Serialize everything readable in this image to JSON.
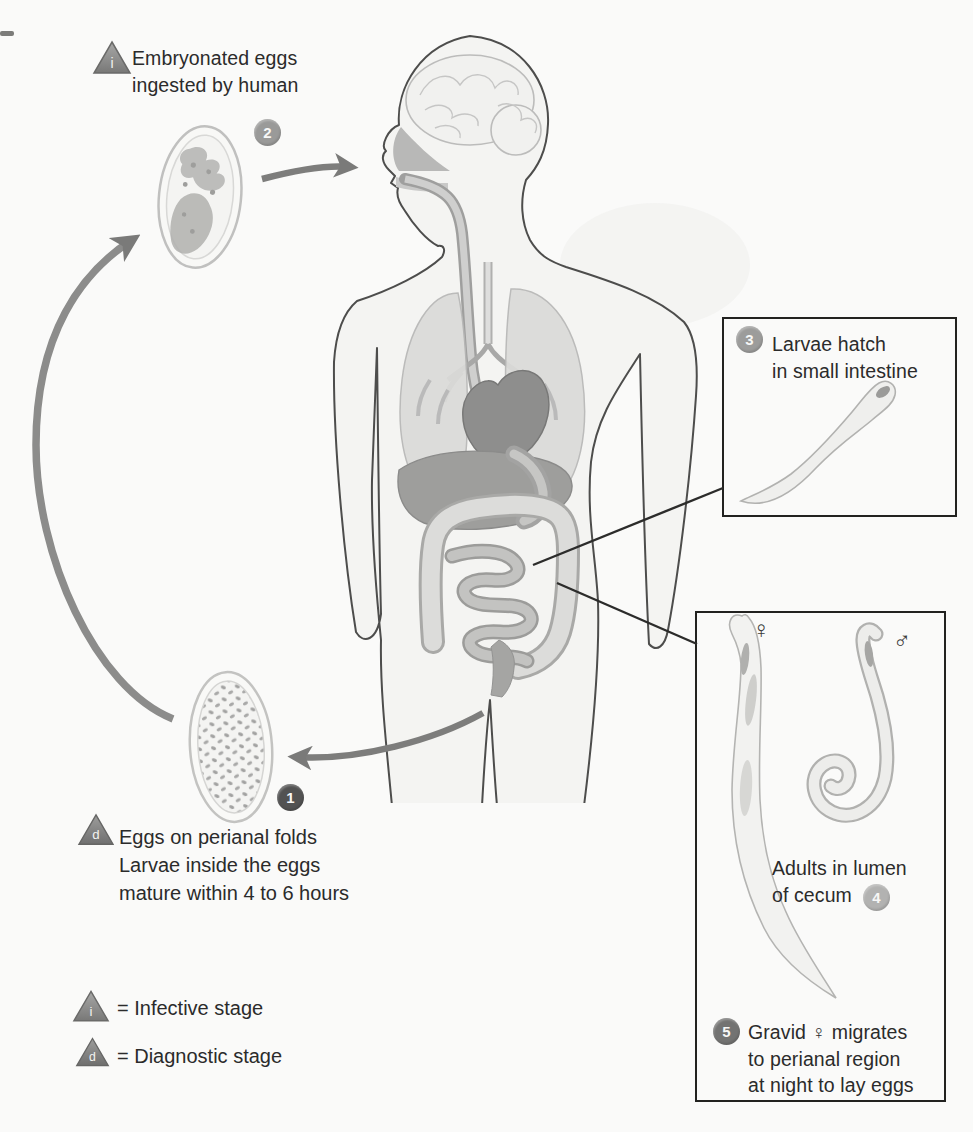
{
  "figure": {
    "title_semantic": "Pinworm life cycle diagram",
    "steps": [
      {
        "num": "1",
        "label": "Eggs on perianal folds\nLarvae inside the eggs\nmature within 4 to 6 hours"
      },
      {
        "num": "2",
        "label": "Embryonated eggs\ningested by human"
      },
      {
        "num": "3",
        "label": "Larvae hatch\nin small intestine"
      },
      {
        "num": "4",
        "label": "Adults in lumen\nof cecum"
      },
      {
        "num": "5",
        "label": "Gravid ♀ migrates\nto perianal region\nat night to lay eggs"
      }
    ],
    "markers": {
      "infective": "i",
      "diagnostic": "d"
    },
    "legend": {
      "infective": "= Infective stage",
      "diagnostic": "= Diagnostic stage"
    },
    "symbols": {
      "female": "♀",
      "male": "♂"
    },
    "colors": {
      "circle_1": "#525252",
      "circle_2": "#9a9a99",
      "circle_3": "#9c9c9b",
      "circle_4": "#b2b2b1",
      "circle_5": "#737372",
      "triangle_gray": "#8f8f8e",
      "arrow_gray": "#7d7d7c",
      "leader_line": "#2c2c2c",
      "box_border": "#222220",
      "body_fill": "#f4f4f2",
      "organ_dark": "#8e8e8e"
    }
  }
}
